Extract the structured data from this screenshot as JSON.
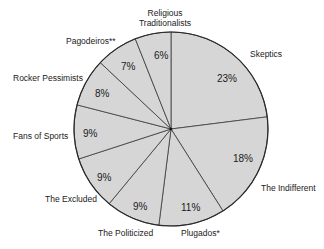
{
  "chart_data": {
    "type": "pie",
    "title": "",
    "start_angle_deg": 0,
    "direction": "clockwise",
    "categories": [
      "Skeptics",
      "The Indifferent",
      "Plugados*",
      "The Politicized",
      "The Excluded",
      "Fans of Sports",
      "Rocker Pessimists",
      "Pagodeiros**",
      "Religious Traditionalists"
    ],
    "values": [
      23,
      18,
      11,
      9,
      9,
      9,
      8,
      7,
      6
    ],
    "value_labels": [
      "23%",
      "18%",
      "11%",
      "9%",
      "9%",
      "9%",
      "8%",
      "7%",
      "6%"
    ],
    "legend": "none (external slice labels)",
    "colors": {
      "fill": "#d6d6d6",
      "stroke": "#3a3a3a",
      "background": "#ffffff"
    }
  },
  "labels": {
    "skeptics": "Skeptics",
    "indifferent": "The Indifferent",
    "plugados": "Plugados*",
    "politicized": "The Politicized",
    "excluded": "The Excluded",
    "sports": "Fans of Sports",
    "rocker": "Rocker Pessimists",
    "pagodeiros": "Pagodeiros**",
    "religious_line1": "Religious",
    "religious_line2": "Traditionalists"
  },
  "percents": {
    "skeptics": "23%",
    "indifferent": "18%",
    "plugados": "11%",
    "politicized": "9%",
    "excluded": "9%",
    "sports": "9%",
    "rocker": "8%",
    "pagodeiros": "7%",
    "religious": "6%"
  }
}
